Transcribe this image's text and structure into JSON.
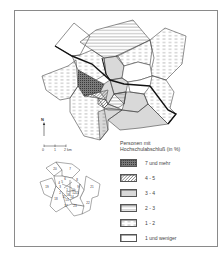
{
  "map": {
    "title": "Personen mit Hochschulabschluß (in %)",
    "north_label": "N",
    "scale": {
      "ticks": [
        "0",
        "1",
        "2 km"
      ]
    },
    "colors": {
      "frame": "#8a8a8a",
      "line": "#333333",
      "thick_line": "#111111",
      "dark_fill": "#6a6a6a",
      "hatch": "#555555"
    }
  },
  "legend": {
    "title_line1": "Personen mit",
    "title_line2": "Hochschulabschluß (in %)",
    "items": [
      {
        "label": "7 und mehr",
        "pattern": "crosshatch-dark"
      },
      {
        "label": "4 - 5",
        "pattern": "diagonal-hatch"
      },
      {
        "label": "3 - 4",
        "pattern": "dense-horizontal"
      },
      {
        "label": "2 - 3",
        "pattern": "sparse-horizontal"
      },
      {
        "label": "1 - 2",
        "pattern": "dashed-horizontal"
      },
      {
        "label": "1 und weniger",
        "pattern": "empty"
      }
    ]
  },
  "inset_map": {
    "districts": [
      "1",
      "2",
      "3",
      "4",
      "5",
      "6",
      "7",
      "8",
      "9",
      "10",
      "11",
      "12",
      "13",
      "14",
      "15",
      "16",
      "17",
      "18",
      "19",
      "20",
      "21",
      "22",
      "23"
    ]
  }
}
